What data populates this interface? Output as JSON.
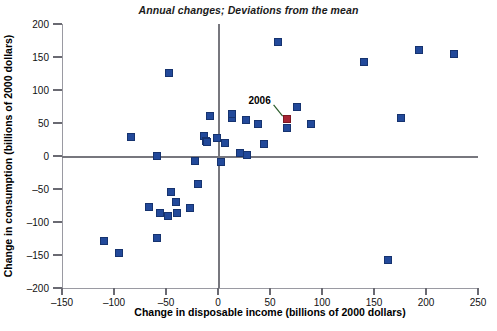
{
  "chart_data": {
    "type": "scatter",
    "title": "Annual changes; Deviations from the mean",
    "xlabel": "Change in disposable income (billions of 2000 dollars)",
    "ylabel": "Change in consumption (billions of 2000 dollars)",
    "xlim": [
      -150,
      250
    ],
    "ylim": [
      -200,
      200
    ],
    "xticks": [
      -150,
      -100,
      -50,
      0,
      50,
      100,
      150,
      200,
      250
    ],
    "yticks": [
      -200,
      -150,
      -100,
      -50,
      0,
      50,
      100,
      150,
      200
    ],
    "xtick_labels": [
      "–150",
      "–100",
      "–50",
      "0",
      "50",
      "100",
      "150",
      "200",
      "250"
    ],
    "ytick_labels": [
      "–200",
      "–150",
      "–100",
      "–50",
      "0",
      "50",
      "100",
      "150",
      "200"
    ],
    "grid": false,
    "legend": false,
    "zero_lines": true,
    "series": [
      {
        "name": "Annual changes",
        "color": "#22499a",
        "marker": "square",
        "points": [
          {
            "x": -84,
            "y": 29
          },
          {
            "x": -110,
            "y": -129
          },
          {
            "x": -95,
            "y": -147
          },
          {
            "x": -47,
            "y": 126
          },
          {
            "x": -59,
            "y": -124
          },
          {
            "x": -66,
            "y": -78
          },
          {
            "x": -56,
            "y": -86
          },
          {
            "x": -48,
            "y": -91
          },
          {
            "x": -39,
            "y": -86
          },
          {
            "x": -45,
            "y": -55
          },
          {
            "x": -40,
            "y": -70
          },
          {
            "x": -27,
            "y": -79
          },
          {
            "x": -19,
            "y": -42
          },
          {
            "x": -22,
            "y": -8
          },
          {
            "x": -59,
            "y": 0
          },
          {
            "x": -13,
            "y": 30
          },
          {
            "x": -8,
            "y": 60
          },
          {
            "x": -12,
            "y": 23
          },
          {
            "x": -11,
            "y": 21
          },
          {
            "x": -1,
            "y": 27
          },
          {
            "x": 7,
            "y": 19
          },
          {
            "x": 13,
            "y": 58
          },
          {
            "x": 13,
            "y": 64
          },
          {
            "x": 21,
            "y": 4
          },
          {
            "x": 27,
            "y": 55
          },
          {
            "x": 28,
            "y": 2
          },
          {
            "x": 3,
            "y": -9
          },
          {
            "x": 38,
            "y": 48
          },
          {
            "x": 44,
            "y": 18
          },
          {
            "x": 58,
            "y": 173
          },
          {
            "x": 66,
            "y": 43
          },
          {
            "x": 76,
            "y": 74
          },
          {
            "x": 89,
            "y": 49
          },
          {
            "x": 140,
            "y": 142
          },
          {
            "x": 176,
            "y": 57
          },
          {
            "x": 193,
            "y": 161
          },
          {
            "x": 227,
            "y": 155
          },
          {
            "x": 163,
            "y": -158
          }
        ]
      },
      {
        "name": "2006",
        "color": "#a62433",
        "marker": "square",
        "points": [
          {
            "x": 66,
            "y": 56
          }
        ]
      }
    ],
    "annotations": [
      {
        "label": "2006",
        "x": 40,
        "y": 85,
        "points_to": {
          "x": 66,
          "y": 56
        }
      }
    ]
  }
}
